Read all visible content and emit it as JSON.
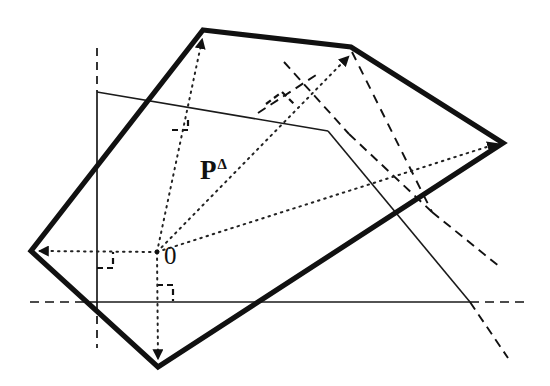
{
  "figure": {
    "canvas": {
      "width": 550,
      "height": 386,
      "background": "#ffffff"
    },
    "colors": {
      "ink": "#111111",
      "polygon_stroke": "#111111",
      "thin_line": "#1a1a1a",
      "dashed_line": "#111111",
      "dotted_ray": "#222222"
    },
    "labels": {
      "origin": "0",
      "polytope": "P",
      "polytope_superscript": "Δ"
    },
    "geometry": {
      "origin_point": [
        157,
        252
      ],
      "axes": {
        "horizontal_y": 302,
        "horizontal_solid_from_x": 97,
        "horizontal_solid_to_x": 470,
        "horizontal_dashed_left_from_x": 30,
        "horizontal_dashed_right_to_x": 528,
        "vertical_x": 97,
        "vertical_solid_from_y": 92,
        "vertical_solid_to_y": 302,
        "vertical_dashed_top_from_y": 48,
        "vertical_dashed_bottom_to_y": 348
      },
      "polygon_vertices": [
        [
          203,
          30
        ],
        [
          351,
          47
        ],
        [
          503,
          143
        ],
        [
          158,
          367
        ],
        [
          31,
          251
        ]
      ],
      "rays_from_origin": [
        {
          "name": "ray-up-left-vertex",
          "to": [
            203,
            33
          ],
          "arrow": true
        },
        {
          "name": "ray-up-right-vertex",
          "to": [
            351,
            50
          ],
          "arrow": true
        },
        {
          "name": "ray-right-vertex",
          "to": [
            499,
            143
          ],
          "arrow": true
        },
        {
          "name": "ray-left-vertex",
          "to": [
            35,
            251
          ],
          "arrow": true
        },
        {
          "name": "ray-down-vertex",
          "to": [
            158,
            362
          ],
          "arrow": true
        }
      ],
      "support_lines": [
        {
          "name": "support-line-upper",
          "from": [
            97,
            92
          ],
          "to": [
            328,
            131
          ]
        },
        {
          "name": "support-line-right",
          "from": [
            328,
            131
          ],
          "to": [
            470,
            302
          ]
        }
      ],
      "dashed_segments": [
        {
          "name": "dashed-normal-upper-left",
          "from": [
            285,
            63
          ],
          "to": [
            347,
            133
          ]
        },
        {
          "name": "dashed-normal-crossing",
          "from": [
            262,
            110
          ],
          "to": [
            312,
            78
          ]
        },
        {
          "name": "dashed-normal-vertical",
          "from": [
            353,
            130
          ],
          "to": [
            432,
            212
          ]
        },
        {
          "name": "dashed-normal-right",
          "from": [
            347,
            133
          ],
          "to": [
            432,
            212
          ]
        },
        {
          "name": "dashed-tail-right",
          "from": [
            432,
            212
          ],
          "to": [
            497,
            265
          ]
        },
        {
          "name": "dashed-tail-bottom",
          "from": [
            470,
            302
          ],
          "to": [
            505,
            355
          ]
        }
      ],
      "right_angle_marks": [
        {
          "name": "right-angle-mark-center",
          "at": [
            186,
            128
          ],
          "size": 14
        },
        {
          "name": "right-angle-mark-upper",
          "at": [
            275,
            88
          ],
          "size": 15
        },
        {
          "name": "right-angle-mark-origin-left",
          "at": [
            97,
            252
          ],
          "size": 16
        },
        {
          "name": "right-angle-mark-origin-below",
          "at": [
            157,
            283
          ],
          "size": 14
        }
      ]
    }
  }
}
